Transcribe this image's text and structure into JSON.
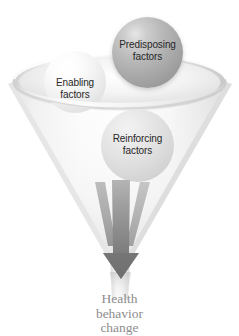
{
  "diagram": {
    "funnel": {
      "name": "funnel",
      "rim_label": "",
      "colors": {
        "funnel_fill_light": "#f7f7f7",
        "funnel_fill_mid": "#ededed",
        "funnel_edge": "#dcdcdc",
        "arrow_dark": "#6f6f6f",
        "arrow_mid": "#9a9a9a",
        "arrow_light": "#c9c9c9",
        "caption_text": "#8d8d8d",
        "sphere_label_text": "#272727",
        "background": "#ffffff"
      }
    },
    "spheres": [
      {
        "id": "predisposing",
        "label_line1": "Predisposing",
        "label_line2": "factors",
        "shade": "dark-gray"
      },
      {
        "id": "enabling",
        "label_line1": "Enabling",
        "label_line2": "factors",
        "shade": "white"
      },
      {
        "id": "reinforcing",
        "label_line1": "Reinforcing",
        "label_line2": "factors",
        "shade": "light-gray"
      }
    ],
    "outcome": {
      "line1": "Health",
      "line2": "behavior",
      "line3": "change"
    }
  }
}
